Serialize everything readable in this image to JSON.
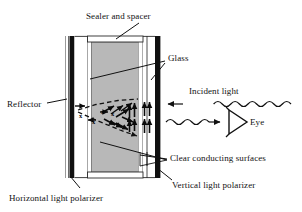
{
  "figure": {
    "type": "labeled cross-section diagram",
    "background_color": "#ffffff",
    "line_color": "#111111",
    "polarizer_color": "#101010",
    "liquid_crystal_fill": "#b8b8b8",
    "glass_fill": "#ffffff"
  },
  "labels": {
    "sealer_and_spacer": "Sealer and spacer",
    "glass": "Glass",
    "incident_light": "Incident light",
    "eye": "Eye",
    "reflector": "Reflector",
    "clear_conducting_surfaces": "Clear conducting surfaces",
    "vertical_light_polarizer": "Vertical light polarizer",
    "horizontal_light_polarizer": "Horizontal light polarizer",
    "x_marker_1": "x",
    "x_marker_2": "x",
    "x_marker_3": "x",
    "x_marker_4": "x"
  },
  "layers": [
    {
      "name": "reflector",
      "role": "back reflector line"
    },
    {
      "name": "horizontal-light-polarizer",
      "role": "black bar, left"
    },
    {
      "name": "glass-left",
      "role": "outer glass plate, left"
    },
    {
      "name": "clear-conducting-surface-left",
      "role": "transparent electrode, left"
    },
    {
      "name": "liquid-crystal",
      "role": "gray twisted nematic region"
    },
    {
      "name": "clear-conducting-surface-right",
      "role": "transparent electrode, right"
    },
    {
      "name": "glass-right",
      "role": "outer glass plate, right"
    },
    {
      "name": "vertical-light-polarizer",
      "role": "black bar, right"
    },
    {
      "name": "sealer-and-spacer",
      "role": "top and bottom seal frame"
    }
  ],
  "annotations": {
    "twist_arrows_count": 12,
    "vertical_polarized_arrows_count": 8,
    "wave_lines": 2,
    "wave_direction_in": "leftward (into cell)",
    "wave_direction_out": "rightward (toward eye)"
  }
}
